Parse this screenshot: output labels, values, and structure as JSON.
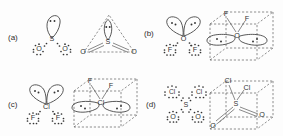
{
  "figure": {
    "background_color": "#fdfdfd",
    "ink_color": "#333333",
    "panel_count": 4
  },
  "panels": [
    {
      "id": "a",
      "label": "(a)",
      "molecule": "SO2",
      "central_atom": "S",
      "terminal_atoms": [
        "O",
        "O"
      ],
      "lone_pairs_on_center": 1,
      "electron_domains": 3,
      "lewis": {
        "center_label": "S",
        "left_label": "O",
        "right_label": "O",
        "lobe_dots": 2
      },
      "geometry": {
        "shape": "trigonal-planar-dashed",
        "center_label": "S",
        "left_label": "O",
        "right_label": "O",
        "bond_type": "double",
        "lone_pair_dots": 2
      }
    },
    {
      "id": "b",
      "label": "(b)",
      "molecule": "OF2",
      "central_atom": "O",
      "terminal_atoms": [
        "F",
        "F"
      ],
      "lone_pairs_on_center": 2,
      "electron_domains": 4,
      "lewis": {
        "center_label": "O",
        "left_label": "F",
        "right_label": "F",
        "lobe_dots": 2
      },
      "geometry": {
        "shape": "cube-tetrahedral",
        "center_label": "O",
        "top_left_label": "F",
        "top_right_label": "F",
        "bond_type": "single",
        "lone_pair_dots": 2
      }
    },
    {
      "id": "c",
      "label": "(c)",
      "molecule": "ClF2",
      "central_atom": "Cl",
      "terminal_atoms": [
        "F",
        "F"
      ],
      "lone_pairs_on_center": 2,
      "electron_domains": 4,
      "lewis": {
        "center_label": "Cl",
        "left_label": "F",
        "right_label": "F",
        "lobe_dots": 2
      },
      "geometry": {
        "shape": "cube-tetrahedral",
        "center_label": "Cl",
        "top_left_label": "F",
        "top_right_label": "F",
        "bond_type": "single",
        "lone_pair_dots": 2
      }
    },
    {
      "id": "d",
      "label": "(d)",
      "molecule": "SO2Cl2",
      "central_atom": "S",
      "terminal_atoms": [
        "Cl",
        "Cl",
        "O",
        "O"
      ],
      "lone_pairs_on_center": 0,
      "electron_domains": 4,
      "lewis": {
        "center_label": "S",
        "top_left_label": "Cl",
        "top_right_label": "Cl",
        "bottom_left_label": "O",
        "bottom_right_label": "O"
      },
      "geometry": {
        "shape": "cube-tetrahedral",
        "center_label": "S",
        "top_left_label": "Cl",
        "top_right_label": "Cl",
        "bottom_left_label": "O",
        "bottom_right_label": "O",
        "bond_type_cl": "single",
        "bond_type_o": "double"
      }
    }
  ]
}
